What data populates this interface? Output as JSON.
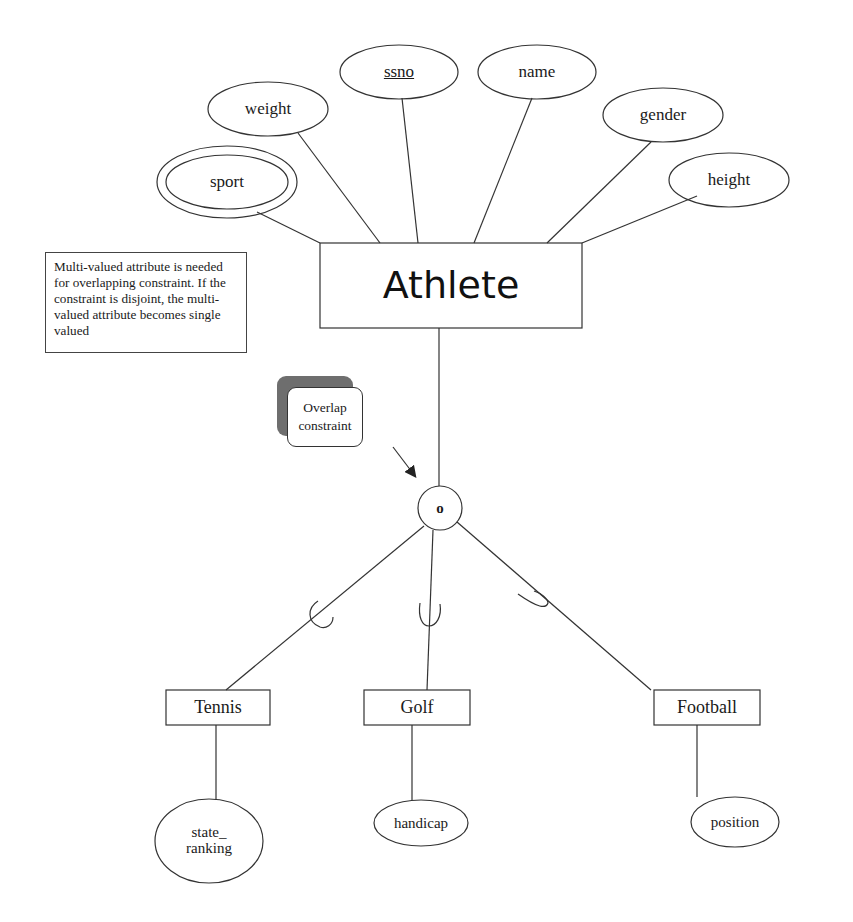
{
  "diagram": {
    "type": "ER diagram (EER specialization)",
    "entity": {
      "name": "Athlete"
    },
    "attributes": [
      {
        "name": "sport",
        "kind": "multi-valued"
      },
      {
        "name": "weight",
        "kind": "simple"
      },
      {
        "name": "ssno",
        "kind": "key"
      },
      {
        "name": "name",
        "kind": "simple"
      },
      {
        "name": "gender",
        "kind": "simple"
      },
      {
        "name": "height",
        "kind": "simple"
      }
    ],
    "note": "Multi-valued attribute is needed for overlapping constraint.  If the constraint is disjoint, the multi-valued attribute becomes single valued",
    "callout": {
      "line1": "Overlap",
      "line2": "constraint"
    },
    "specialization": {
      "symbol": "o",
      "constraint": "overlapping"
    },
    "subclasses": [
      {
        "name": "Tennis",
        "attribute_line1": "state_",
        "attribute_line2": "ranking"
      },
      {
        "name": "Golf",
        "attribute_line1": "handicap",
        "attribute_line2": ""
      },
      {
        "name": "Football",
        "attribute_line1": "position",
        "attribute_line2": ""
      }
    ]
  }
}
